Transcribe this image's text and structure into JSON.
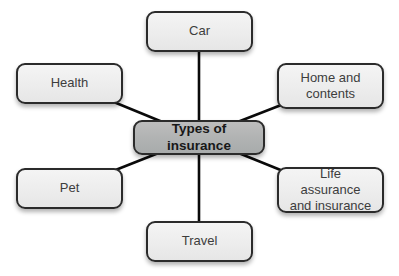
{
  "diagram": {
    "title": "Types of insurance",
    "center": {
      "label": "Types of insurance"
    },
    "nodes": [
      {
        "id": "car",
        "label": "Car"
      },
      {
        "id": "health",
        "label": "Health"
      },
      {
        "id": "home-and-contents",
        "label": "Home and contents"
      },
      {
        "id": "pet",
        "label": "Pet"
      },
      {
        "id": "life-assurance-and-insurance",
        "label": "Life assurance and insurance"
      },
      {
        "id": "travel",
        "label": "Travel"
      }
    ],
    "colors": {
      "background": "#ffffff",
      "node_fill": "#eeeeee",
      "center_fill": "#b2b4b4",
      "border": "#2b2b2b",
      "connector": "#0a0a0a",
      "node_text": "#3d3d3d",
      "center_text": "#181818"
    }
  }
}
